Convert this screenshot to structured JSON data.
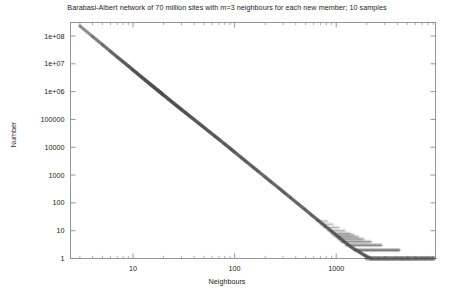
{
  "chart_data": {
    "type": "scatter",
    "title": "Barabasi-Albert network of 70 million sites with m=3 neighbours for each new member; 10 samples",
    "xlabel": "Neighbours",
    "ylabel": "Number",
    "xscale": "log",
    "yscale": "log",
    "xlim": [
      2.4,
      11000
    ],
    "ylim": [
      0.8,
      400000000
    ],
    "grid": false,
    "legend": null,
    "marker": "+",
    "marker_color": "#555555",
    "axis_color": "#8a8a8a",
    "background": "#ffffff",
    "xticks": [
      {
        "value": 10,
        "label": "10"
      },
      {
        "value": 100,
        "label": "100"
      },
      {
        "value": 1000,
        "label": "1000"
      },
      {
        "value": 10000,
        "label": "10000"
      }
    ],
    "yticks": [
      {
        "value": 100000000,
        "label": "1e+08"
      },
      {
        "value": 10000000,
        "label": "1e+07"
      },
      {
        "value": 1000000,
        "label": "1e+06"
      },
      {
        "value": 100000,
        "label": "100000"
      },
      {
        "value": 10000,
        "label": "10000"
      },
      {
        "value": 1000,
        "label": "1000"
      },
      {
        "value": 100,
        "label": "100"
      },
      {
        "value": 10,
        "label": "10"
      },
      {
        "value": 1,
        "label": "1"
      }
    ],
    "series": [
      {
        "name": "degree distribution",
        "description": "Power-law degree distribution, slope approximately -3 on log-log axes",
        "points": [
          [
            3,
            230000000
          ],
          [
            4,
            96000000
          ],
          [
            5,
            49000000
          ],
          [
            6,
            28000000
          ],
          [
            7,
            17500000
          ],
          [
            8,
            11800000
          ],
          [
            9,
            8300000
          ],
          [
            10,
            6000000
          ],
          [
            11,
            4500000
          ],
          [
            12,
            3450000
          ],
          [
            13,
            2720000
          ],
          [
            14,
            2180000
          ],
          [
            15,
            1770000
          ],
          [
            16,
            1460000
          ],
          [
            17,
            1220000
          ],
          [
            18,
            1030000
          ],
          [
            19,
            875000
          ],
          [
            20,
            750000
          ],
          [
            22,
            565000
          ],
          [
            24,
            435000
          ],
          [
            26,
            345000
          ],
          [
            28,
            278000
          ],
          [
            30,
            227000
          ],
          [
            33,
            172000
          ],
          [
            36,
            133000
          ],
          [
            40,
            98500
          ],
          [
            45,
            69800
          ],
          [
            50,
            51200
          ],
          [
            56,
            36900
          ],
          [
            63,
            26200
          ],
          [
            70,
            19300
          ],
          [
            80,
            13000
          ],
          [
            90,
            9200
          ],
          [
            100,
            6700
          ],
          [
            115,
            4400
          ],
          [
            130,
            3060
          ],
          [
            150,
            2000
          ],
          [
            170,
            1380
          ],
          [
            200,
            850
          ],
          [
            230,
            560
          ],
          [
            270,
            350
          ],
          [
            310,
            230
          ],
          [
            360,
            148
          ],
          [
            420,
            93
          ],
          [
            490,
            59
          ],
          [
            570,
            37
          ],
          [
            660,
            24
          ],
          [
            770,
            15
          ],
          [
            900,
            9.5
          ],
          [
            1050,
            6
          ],
          [
            1200,
            4
          ],
          [
            1400,
            2.6
          ],
          [
            1650,
            1.8
          ],
          [
            1900,
            1.3
          ],
          [
            2200,
            1
          ],
          [
            2600,
            1
          ],
          [
            3100,
            1
          ],
          [
            3700,
            1
          ],
          [
            4400,
            1
          ],
          [
            5200,
            1
          ],
          [
            6200,
            1
          ],
          [
            7500,
            1
          ],
          [
            9000,
            1
          ]
        ]
      }
    ]
  }
}
